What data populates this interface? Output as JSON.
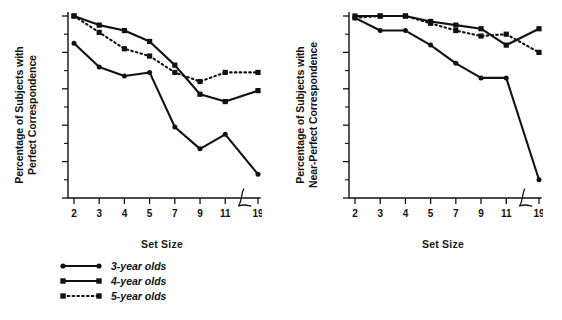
{
  "figure": {
    "width": 562,
    "height": 320,
    "background": "#ffffff",
    "ink_color": "#111111"
  },
  "legend": {
    "items": [
      {
        "label": "3-year olds",
        "marker": "circle",
        "line": "solid",
        "key_name": "legend-key-3-year"
      },
      {
        "label": "4-year olds",
        "marker": "square",
        "line": "solid",
        "key_name": "legend-key-4-year"
      },
      {
        "label": "5-year olds",
        "marker": "square",
        "line": "dotted",
        "key_name": "legend-key-5-year"
      }
    ]
  },
  "axis": {
    "x_categories": [
      "2",
      "3",
      "4",
      "5",
      "7",
      "9",
      "11",
      "19"
    ],
    "x_break_after": "11",
    "y_ticks": [
      "0",
      "20",
      "40",
      "60",
      "80",
      "100"
    ],
    "y_minor_step": 10,
    "ylim": [
      0,
      100
    ],
    "xlabel": "Set Size"
  },
  "chart_data": [
    {
      "type": "line",
      "panel": "left",
      "title": "",
      "xlabel": "Set Size",
      "ylabel": "Percentage of Subjects with Perfect Correspondence",
      "categories": [
        "2",
        "3",
        "4",
        "5",
        "7",
        "9",
        "11",
        "19"
      ],
      "x": [
        2,
        3,
        4,
        5,
        7,
        9,
        11,
        19
      ],
      "ylim": [
        0,
        100
      ],
      "xlim_note": "axis break between 11 and 19",
      "grid": false,
      "legend_position": "below-figure-left",
      "series": [
        {
          "name": "3-year olds",
          "marker": "circle",
          "line": "solid",
          "values": [
            85,
            72,
            67,
            69,
            39,
            27,
            35,
            13
          ]
        },
        {
          "name": "4-year olds",
          "marker": "square",
          "line": "solid",
          "values": [
            100,
            95,
            92,
            86,
            73,
            57,
            53,
            59
          ]
        },
        {
          "name": "5-year olds",
          "marker": "square",
          "line": "dotted",
          "values": [
            100,
            91,
            82,
            78,
            69,
            64,
            69,
            69
          ]
        }
      ]
    },
    {
      "type": "line",
      "panel": "right",
      "title": "",
      "xlabel": "Set Size",
      "ylabel": "Percentage of Subjects with Near-Perfect Correspondence",
      "categories": [
        "2",
        "3",
        "4",
        "5",
        "7",
        "9",
        "11",
        "19"
      ],
      "x": [
        2,
        3,
        4,
        5,
        7,
        9,
        11,
        19
      ],
      "ylim": [
        0,
        100
      ],
      "xlim_note": "axis break between 11 and 19",
      "grid": false,
      "legend_position": "shared-below-figure-left",
      "series": [
        {
          "name": "3-year olds",
          "marker": "circle",
          "line": "solid",
          "values": [
            99,
            92,
            92,
            84,
            74,
            66,
            66,
            10
          ]
        },
        {
          "name": "4-year olds",
          "marker": "square",
          "line": "solid",
          "values": [
            100,
            100,
            100,
            97,
            95,
            93,
            84,
            93
          ]
        },
        {
          "name": "5-year olds",
          "marker": "square",
          "line": "dotted",
          "values": [
            99,
            100,
            100,
            96,
            92,
            89,
            90,
            80
          ]
        }
      ]
    }
  ],
  "panels": {
    "left": {
      "ylabel_line1": "Percentage of Subjects with",
      "ylabel_line2": "Perfect Correspondence"
    },
    "right": {
      "ylabel_line1": "Percentage of Subjects with",
      "ylabel_line2": "Near-Perfect Correspondence"
    }
  }
}
